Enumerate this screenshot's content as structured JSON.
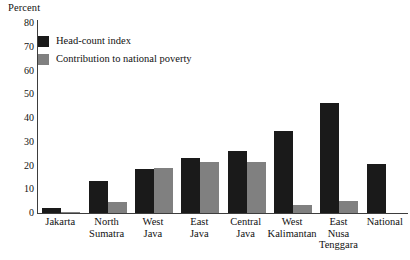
{
  "chart_data": {
    "type": "bar",
    "title": "",
    "xlabel": "",
    "ylabel": "Percent",
    "ylim": [
      0,
      80
    ],
    "yticks": [
      80,
      70,
      60,
      50,
      40,
      30,
      20,
      10,
      0
    ],
    "grid": false,
    "legend_position": "top-left",
    "categories": [
      "Jakarta",
      "North Sumatra",
      "West Java",
      "East Java",
      "Central Java",
      "West Kalimantan",
      "East Nusa Tenggara",
      "National"
    ],
    "category_lines": [
      [
        "Jakarta"
      ],
      [
        "North",
        "Sumatra"
      ],
      [
        "West",
        "Java"
      ],
      [
        "East",
        "Java"
      ],
      [
        "Central",
        "Java"
      ],
      [
        "West",
        "Kalimantan"
      ],
      [
        "East",
        "Nusa",
        "Tenggara"
      ],
      [
        "National"
      ]
    ],
    "series": [
      {
        "name": "Head-count index",
        "color": "#1a1a1a",
        "values": [
          2.0,
          13.5,
          18.5,
          23.0,
          26.0,
          34.5,
          46.5,
          20.5
        ]
      },
      {
        "name": "Contribution to national poverty",
        "color": "#808080",
        "values": [
          0.5,
          4.5,
          19.0,
          21.5,
          21.5,
          3.5,
          5.0,
          null
        ]
      }
    ]
  },
  "legend": {
    "items": [
      {
        "label": "Head-count index",
        "color": "#1a1a1a"
      },
      {
        "label": "Contribution to national poverty",
        "color": "#808080"
      }
    ]
  },
  "axis": {
    "y_title": "Percent"
  }
}
